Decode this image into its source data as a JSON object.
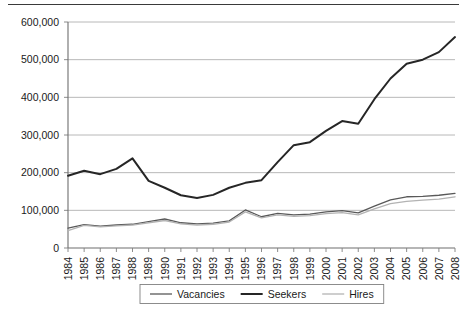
{
  "chart_data": {
    "type": "line",
    "title": "",
    "subtitle": "",
    "xlabel": "",
    "ylabel": "",
    "grid": true,
    "legend_position": "bottom",
    "categories": [
      "1984",
      "1985",
      "1986",
      "1987",
      "1988",
      "1989",
      "1990",
      "1991",
      "1992",
      "1993",
      "1994",
      "1995",
      "1996",
      "1997",
      "1998",
      "1999",
      "2000",
      "2001",
      "2002",
      "2003",
      "2004",
      "2005",
      "2006",
      "2007",
      "2008"
    ],
    "ylim": [
      0,
      600000
    ],
    "yticks": [
      0,
      100000,
      200000,
      300000,
      400000,
      500000,
      600000
    ],
    "ytick_labels": [
      "0",
      "100,000",
      "200,000",
      "300,000",
      "400,000",
      "500,000",
      "600,000"
    ],
    "series": [
      {
        "name": "Vacancies",
        "color": "#595959",
        "width": 1.3,
        "values": [
          53000,
          62000,
          58000,
          61000,
          63000,
          70000,
          77000,
          67000,
          64000,
          66000,
          72000,
          101000,
          83000,
          92000,
          88000,
          90000,
          96000,
          99000,
          93000,
          111000,
          128000,
          136000,
          137000,
          140000,
          145000
        ]
      },
      {
        "name": "Seekers",
        "color": "#262626",
        "width": 2.0,
        "values": [
          192000,
          205000,
          196000,
          210000,
          238000,
          178000,
          160000,
          140000,
          133000,
          141000,
          160000,
          173000,
          180000,
          228000,
          273000,
          281000,
          311000,
          337000,
          330000,
          395000,
          450000,
          489000,
          500000,
          520000,
          560000
        ]
      },
      {
        "name": "Hires",
        "color": "#b3b3b3",
        "width": 1.3,
        "values": [
          46000,
          60000,
          56000,
          59000,
          61000,
          67000,
          73000,
          64000,
          61000,
          63000,
          69000,
          96000,
          80000,
          88000,
          84000,
          86000,
          91000,
          94000,
          88000,
          104000,
          118000,
          124000,
          127000,
          130000,
          136000
        ]
      }
    ]
  },
  "legend": {
    "items": [
      {
        "label": "Vacancies",
        "color": "#595959",
        "width": 1.3
      },
      {
        "label": "Seekers",
        "color": "#262626",
        "width": 2.0
      },
      {
        "label": "Hires",
        "color": "#b3b3b3",
        "width": 1.3
      }
    ]
  },
  "axes": {
    "gridline_color": "#b0b0b0",
    "axis_color": "#808080",
    "top_rule_color": "#3a3a3a"
  }
}
